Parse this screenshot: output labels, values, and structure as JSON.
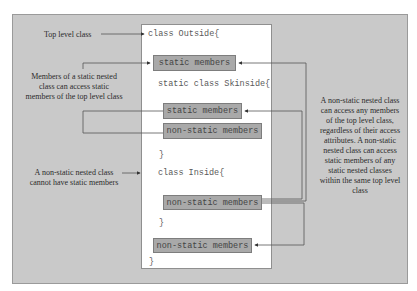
{
  "annotations": {
    "top_level_class": "Top level class",
    "static_nested_access": "Members of a static nested class can access static members of the top level class",
    "non_static_no_static": "A non-static nested class cannot have static members",
    "non_static_access": "A non-static nested class can access any members of the top level class, regardless of their access attributes. A non-static nested class can access static members of any static nested classes within the same top level class"
  },
  "code": {
    "outside_open": "class Outside{",
    "outside_static_members": "static members",
    "skinside_open": "static class Skinside{",
    "skinside_static_members": "static members",
    "skinside_nonstatic_members": "non-static members",
    "skinside_close": "}",
    "inside_open": "class Inside{",
    "inside_nonstatic_members": "non-static members",
    "inside_close": "}",
    "outside_nonstatic_members": "non-static members",
    "outside_close": "}"
  },
  "colors": {
    "frame_bg": "#c9c9c9",
    "member_box_bg": "#a9a9a9",
    "line": "#555555"
  }
}
